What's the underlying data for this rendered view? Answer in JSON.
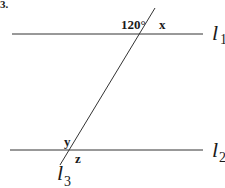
{
  "problem_number": "3.",
  "lines": {
    "l1": {
      "label": "l",
      "subscript": "1"
    },
    "l2": {
      "label": "l",
      "subscript": "2"
    },
    "l3": {
      "label": "l",
      "subscript": "3"
    }
  },
  "angles": {
    "given": "120°",
    "x": "x",
    "y": "y",
    "z": "z"
  }
}
